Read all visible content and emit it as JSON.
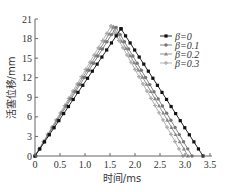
{
  "chart_data": {
    "type": "line",
    "title": "",
    "xlabel": "时间/ms",
    "ylabel": "活塞位移/mm",
    "xlim": [
      0,
      3.5
    ],
    "ylim": [
      0,
      21
    ],
    "xticks": [
      "0",
      "0.5",
      "1.0",
      "1.5",
      "2.0",
      "2.5",
      "3.0",
      "3.5"
    ],
    "yticks": [
      "0",
      "3",
      "6",
      "9",
      "12",
      "15",
      "18",
      "21"
    ],
    "grid": false,
    "legend_position": "upper right",
    "series": [
      {
        "name": "β=0",
        "marker": "square",
        "color": "#111111",
        "points": [
          [
            0,
            0
          ],
          [
            1.72,
            19.5
          ],
          [
            3.36,
            0
          ]
        ]
      },
      {
        "name": "β=0.1",
        "marker": "circle",
        "color": "#777777",
        "points": [
          [
            0,
            0
          ],
          [
            1.62,
            19.7
          ],
          [
            3.14,
            0
          ]
        ]
      },
      {
        "name": "β=0.2",
        "marker": "triangle",
        "color": "#888888",
        "points": [
          [
            0,
            0
          ],
          [
            1.57,
            19.8
          ],
          [
            3.06,
            0
          ]
        ]
      },
      {
        "name": "β=0.3",
        "marker": "star",
        "color": "#aaaaaa",
        "points": [
          [
            0,
            0
          ],
          [
            1.52,
            19.9
          ],
          [
            2.96,
            0
          ]
        ]
      }
    ]
  }
}
